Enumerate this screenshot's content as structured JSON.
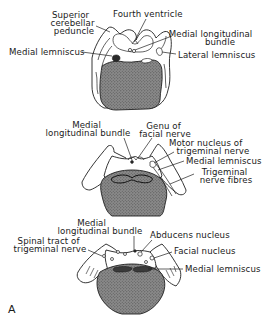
{
  "figure": {
    "panel_letter": "A",
    "colors": {
      "ink": "#1f1f1f",
      "stipple_fill": "#7a7a7a",
      "background": "#ffffff"
    },
    "sections": [
      {
        "name": "upper-pons-section",
        "labels": [
          {
            "lines": [
              "Superior",
              "cerebellar",
              "peduncle"
            ]
          },
          {
            "lines": [
              "Fourth ventricle"
            ]
          },
          {
            "lines": [
              "Medial longitudinal",
              "bundle"
            ]
          },
          {
            "lines": [
              "Medial lemniscus"
            ]
          },
          {
            "lines": [
              "Lateral lemniscus"
            ]
          }
        ]
      },
      {
        "name": "mid-pons-section",
        "labels": [
          {
            "lines": [
              "Medial",
              "longitudinal bundle"
            ]
          },
          {
            "lines": [
              "Genu of",
              "facial nerve"
            ]
          },
          {
            "lines": [
              "Motor nucleus of",
              "trigeminal nerve"
            ]
          },
          {
            "lines": [
              "Medial lemniscus"
            ]
          },
          {
            "lines": [
              "Trigeminal",
              "nerve fibres"
            ]
          }
        ]
      },
      {
        "name": "lower-pons-section",
        "labels": [
          {
            "lines": [
              "Medial",
              "longitudinal bundle"
            ]
          },
          {
            "lines": [
              "Abducens nucleus"
            ]
          },
          {
            "lines": [
              "Spinal tract of",
              "trigeminal nerve"
            ]
          },
          {
            "lines": [
              "Facial nucleus"
            ]
          },
          {
            "lines": [
              "Medial lemniscus"
            ]
          }
        ]
      }
    ]
  }
}
